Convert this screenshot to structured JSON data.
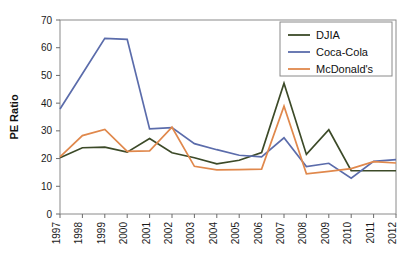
{
  "chart_data": {
    "type": "line",
    "title": "",
    "xlabel": "",
    "ylabel": "PE Ratio",
    "ylim": [
      0,
      70
    ],
    "yticks": [
      0,
      10,
      20,
      30,
      40,
      50,
      60,
      70
    ],
    "ytick_labels": [
      "0",
      "10",
      "20",
      "30",
      "40",
      "50",
      "60",
      "70"
    ],
    "grid": false,
    "legend_position": "top-right",
    "x": [
      1997,
      1998,
      1999,
      2000,
      2001,
      2002,
      2003,
      2004,
      2005,
      2006,
      2007,
      2008,
      2009,
      2010,
      2011,
      2012
    ],
    "categories": [
      "1997",
      "1998",
      "1999",
      "2000",
      "2001",
      "2002",
      "2003",
      "2004",
      "2005",
      "2006",
      "2007",
      "2008",
      "2009",
      "2010",
      "2011",
      "2012"
    ],
    "series": [
      {
        "name": "DJIA",
        "color": "#3c4a28",
        "values": [
          20.3,
          23.9,
          24.1,
          22.3,
          27.2,
          22.1,
          20.3,
          18.1,
          19.4,
          22.2,
          47.2,
          21.5,
          30.4,
          15.6,
          15.6,
          15.6
        ]
      },
      {
        "name": "Coca-Cola",
        "color": "#5b6cab",
        "values": [
          37.9,
          50.6,
          63.4,
          63.0,
          30.7,
          31.2,
          25.4,
          23.2,
          21.2,
          20.6,
          27.5,
          17.1,
          18.3,
          12.9,
          19.0,
          19.6
        ]
      },
      {
        "name": "McDonald's",
        "color": "#e0884c",
        "values": [
          20.6,
          28.3,
          30.5,
          22.6,
          22.8,
          31.3,
          17.2,
          15.9,
          16.0,
          16.2,
          38.9,
          14.5,
          15.4,
          16.4,
          18.9,
          18.4
        ]
      }
    ]
  },
  "legend": {
    "entries": [
      {
        "label": "DJIA"
      },
      {
        "label": "Coca-Cola"
      },
      {
        "label": "McDonald's"
      }
    ]
  },
  "axes": {
    "y_axis_title": "PE Ratio"
  }
}
